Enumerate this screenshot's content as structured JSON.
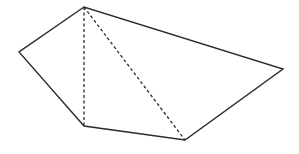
{
  "diagram": {
    "type": "geometry-pentagon",
    "stroke_color": "#2b2b2b",
    "background": "#ffffff",
    "vertices": [
      {
        "id": "A",
        "x": 84,
        "y": 7
      },
      {
        "id": "B",
        "x": 19,
        "y": 52
      },
      {
        "id": "C",
        "x": 84,
        "y": 126
      },
      {
        "id": "D",
        "x": 185,
        "y": 140
      },
      {
        "id": "E",
        "x": 283,
        "y": 69
      }
    ],
    "solid_edges": [
      [
        "A",
        "B"
      ],
      [
        "B",
        "C"
      ],
      [
        "C",
        "D"
      ],
      [
        "D",
        "E"
      ],
      [
        "E",
        "A"
      ]
    ],
    "dashed_edges": [
      [
        "A",
        "C"
      ],
      [
        "A",
        "D"
      ]
    ],
    "labels_visible": false
  }
}
